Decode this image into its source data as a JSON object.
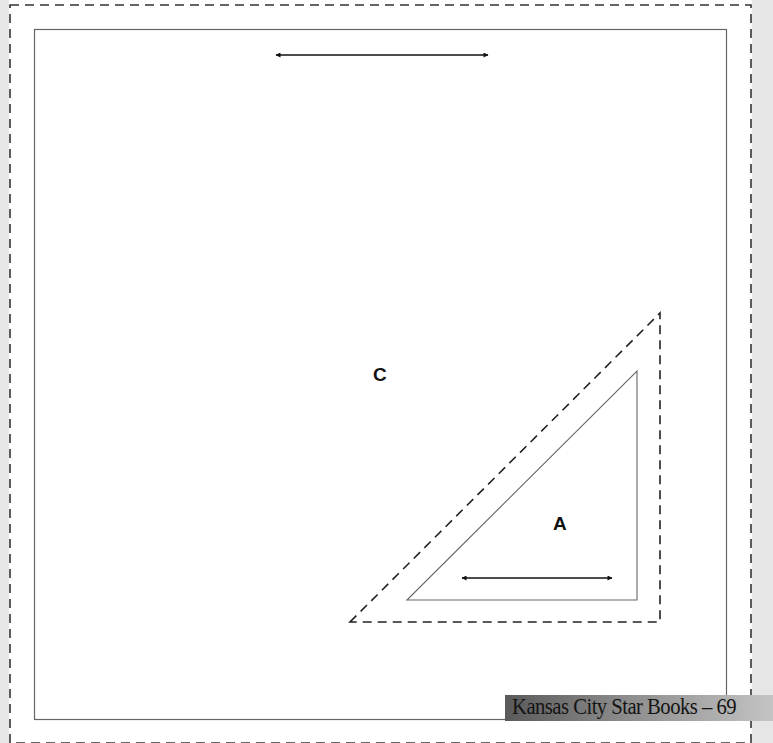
{
  "page": {
    "type": "quilt-pattern-template",
    "background_color": "#ffffff",
    "margin_color": "#e6e6e6"
  },
  "pieces": [
    {
      "id": "C",
      "label": "C",
      "shape": "square",
      "seam_allowance": "dashed outer line",
      "grain_arrow": "horizontal (top)"
    },
    {
      "id": "A",
      "label": "A",
      "shape": "right triangle",
      "seam_allowance": "dashed outer line",
      "grain_arrow": "horizontal (bottom)"
    }
  ],
  "footer": {
    "text": "Kansas City Star Books – 69",
    "publisher": "Kansas City Star Books",
    "page_number": "69"
  },
  "icons": {
    "grain_arrow": "double-headed-arrow-icon"
  }
}
